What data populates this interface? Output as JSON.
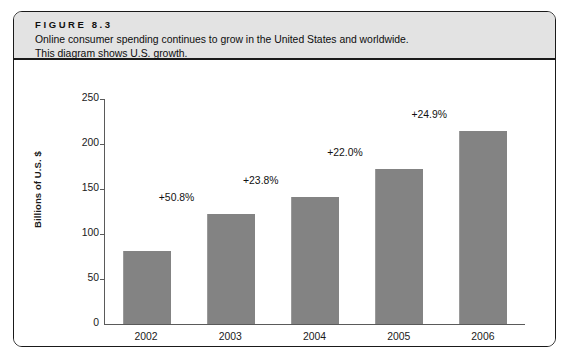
{
  "figure": {
    "number_label": "FIGURE 8.3",
    "caption": "Online consumer spending continues to grow in the United States and worldwide.\nThis diagram shows U.S. growth."
  },
  "colors": {
    "bar_fill": "#838383",
    "header_band": "#e3e3e3",
    "border": "#1a1a1a",
    "axis": "#5a5a5a"
  },
  "chart_data": {
    "type": "bar",
    "title": "",
    "xlabel": "",
    "ylabel": "Billions of U.S. $",
    "categories": [
      "2002",
      "2003",
      "2004",
      "2005",
      "2006"
    ],
    "values": [
      81,
      122,
      141,
      172,
      215
    ],
    "point_labels": [
      "+50.8%",
      "+23.8%",
      "+22.0%",
      "+24.9%"
    ],
    "point_labels_map": {
      "2003": "+50.8%",
      "2004": "+23.8%",
      "2005": "+22.0%",
      "2006": "+24.9%"
    },
    "ylim": [
      0,
      250
    ],
    "yticks": [
      0,
      50,
      100,
      150,
      200,
      250
    ],
    "ytick_labels": [
      "0",
      "50",
      "100",
      "150",
      "200",
      "250"
    ],
    "grid": false,
    "legend": false
  }
}
